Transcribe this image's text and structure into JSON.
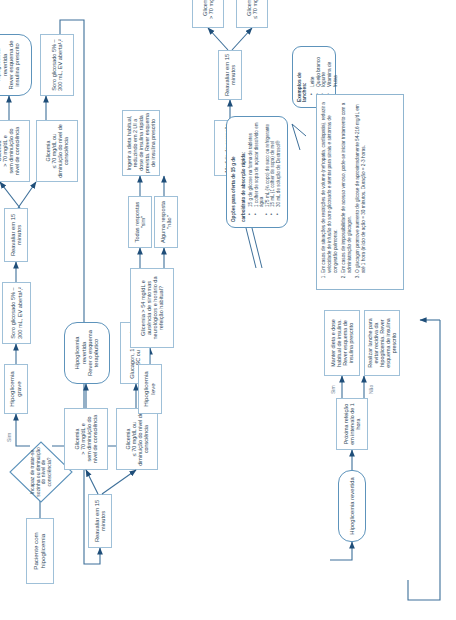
{
  "colors": {
    "stroke": "#5d93bb",
    "box_border": "#7ba7c9",
    "text": "#2f4a5e",
    "label": "#6f8496"
  },
  "nodes": {
    "start": "Paciente com hipoglicemia",
    "decision": "Incapaz de tratar-se sozinha ou diminuição do nível de consciência?",
    "yes_label": "Sim",
    "no_label": "Não",
    "severe": "Hipoglicemia grave",
    "serum_1": "Soro glicosado 5% – 300 mL, EV aberta¹,²",
    "reassess_1": "Reavaliar em 15 minutos",
    "glic_hi_1": "Glicemia\n> 70 mg/dL e\nsem diminuição do nível de consciência",
    "glic_lo_1": "Glicemia\n≤ 70 mg/dL ou\ndiminuição do nível de consciência",
    "reverted_1": "Hipoglicemia revertida\nRever esquema de insulina prescrito",
    "serum_2": "Soro glicosado 5% – 300 mL, EV aberta¹,²",
    "reassess_2": "Reavaliar em 15 minutos",
    "glic_hi_2": "Glicemia\n> 70 mg/dL e\nsem diminuição do nível de consciência",
    "glic_lo_2": "Glicemia\n≤ 70 mg/dL ou\ndiminuição do nível de consciência",
    "reverted_2": "Hipoglicemia revertida\nRever o esquema terapêutico",
    "glucagon": "Glucagon, 1 ampola, SC ou IM³",
    "mild": "Hipoglicemia leve",
    "criteria": "Glicemia > 54 mg/dL e ausência de sintomas neurológicos e horário da refeição habitual?",
    "all_yes": "Todas respostas \"sim\"",
    "some_no": "Alguma resposta \"não\"",
    "diet": "Ingerir a dieta habitual, reduzindo em 2 UI a dose de insulina rápida prevista. Rever esquema de insulina prescrito",
    "correction": "Medida de correção (15 g de glicose)",
    "reassess_3": "Reavaliar em 15 minutos",
    "glic_lo_3": "Glicemia\n≤ 70 mg/dL",
    "glic_hi_3": "Glicemia\n> 70 mg/dL",
    "reverted_3": "Hipoglicemia revertida",
    "next_meal": "Próxima refeição em intervalo de 1 hora",
    "meal_yes_label": "Sim",
    "meal_no_label": "Não",
    "keep_diet": "Manter dieta e dose habitual de insulina. Rever esquema de insulina prescrito",
    "snack": "Realizar lanche para evitar recidiva da hipoglicemia. Rever esquema de insulina prescrito"
  },
  "callout_carbs": {
    "title_line1": "Opções para oferta de 15 g de",
    "title_line2": "carboidrato de absorção rápida:",
    "items": [
      "15 g de glicose na forma de tabletes",
      "1 colher de sopa de açúcar dissolvido em água",
      "175 mL (¾ copo) de suco ou refrigerante",
      "15 mL (1 colher de sopa) de mel",
      "30 mL de solução de Dextrosol®"
    ]
  },
  "callout_snacks": {
    "title": "Exemplos de lanches:",
    "items": [
      "Leite",
      "Queijo branco",
      "Iogurte",
      "Vitamina de frutas"
    ]
  },
  "notes": [
    "Em casos de situações de restrições de volume (nefropatia, cardiopatia), reduzir a velocidade de infusão do soro glicosado e atentar para sinais e sintomas de congestão pulmonar.",
    "Em casos de impossibilidade de acesso venoso, pode-se iniciar tratamento com a administração de glucagon.",
    "O glucagon promove aumento de glicose de aproximadamente 54-216 mg/dL em até 1 hora (início de ação = 30 minutos. Duração = 2-3 horas."
  ]
}
